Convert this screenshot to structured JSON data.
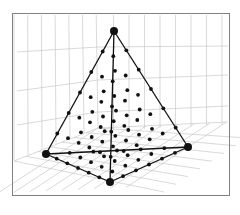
{
  "figure": {
    "title": "",
    "frame_color": "#808080",
    "grid_color": "#c8c8c8",
    "edge_color": "#111111",
    "point_color": "#111111"
  },
  "vertices": [
    {
      "name": "apex",
      "x": 114,
      "y": 31
    },
    {
      "name": "left",
      "x": 46,
      "y": 154
    },
    {
      "name": "front",
      "x": 110,
      "y": 182
    },
    {
      "name": "right",
      "x": 188,
      "y": 147
    }
  ]
}
